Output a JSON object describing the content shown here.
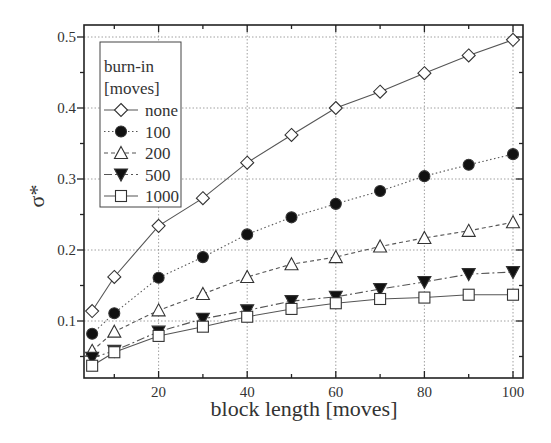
{
  "chart_data": {
    "type": "line",
    "title": "",
    "xlabel": "block length [moves]",
    "ylabel": "σ*",
    "xlim": [
      2,
      101
    ],
    "ylim": [
      0.04,
      0.51
    ],
    "xticks": [
      20,
      40,
      60,
      80,
      100
    ],
    "yticks": [
      0.1,
      0.2,
      0.3,
      0.4,
      0.5
    ],
    "grid": true,
    "legend": {
      "title_line1": "burn-in",
      "title_line2": "[moves]",
      "position": "upper left"
    },
    "x": [
      5,
      10,
      20,
      30,
      40,
      50,
      60,
      70,
      80,
      90,
      100
    ],
    "series": [
      {
        "name": "none",
        "marker": "open-diamond",
        "line": "solid",
        "values": [
          0.114,
          0.162,
          0.234,
          0.273,
          0.323,
          0.362,
          0.4,
          0.423,
          0.449,
          0.474,
          0.496
        ]
      },
      {
        "name": "100",
        "marker": "filled-circle",
        "line": "dotted",
        "values": [
          0.082,
          0.111,
          0.161,
          0.19,
          0.222,
          0.246,
          0.265,
          0.283,
          0.304,
          0.32,
          0.335
        ]
      },
      {
        "name": "200",
        "marker": "open-triangle-up",
        "line": "dashed",
        "values": [
          0.058,
          0.085,
          0.115,
          0.138,
          0.162,
          0.18,
          0.19,
          0.205,
          0.217,
          0.227,
          0.239
        ]
      },
      {
        "name": "500",
        "marker": "filled-triangle-down",
        "line": "dash-dot",
        "values": [
          0.048,
          0.058,
          0.085,
          0.103,
          0.115,
          0.128,
          0.134,
          0.145,
          0.155,
          0.166,
          0.169
        ]
      },
      {
        "name": "1000",
        "marker": "open-square",
        "line": "solid",
        "values": [
          0.037,
          0.056,
          0.079,
          0.092,
          0.106,
          0.117,
          0.125,
          0.131,
          0.133,
          0.137,
          0.137
        ]
      }
    ]
  }
}
